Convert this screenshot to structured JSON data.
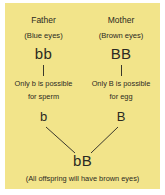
{
  "diagram": {
    "title_semantic": "eye-colour-inheritance-diagram",
    "background_color": "#f2e48a",
    "text_color": "#2b2a22",
    "line_color": "#3a382c",
    "parents": [
      {
        "role_label": "Father",
        "phenotype_label": "(Blue eyes)",
        "genotype": "bb",
        "gamete_note_line1": "Only b is possible",
        "gamete_note_line2": "for sperm",
        "gamete": "b"
      },
      {
        "role_label": "Mother",
        "phenotype_label": "(Brown eyes)",
        "genotype": "BB",
        "gamete_note_line1": "Only B is possible",
        "gamete_note_line2": "for egg",
        "gamete": "B"
      }
    ],
    "offspring": {
      "genotype": "bB",
      "caption": "(All offspring will have brown eyes)"
    }
  }
}
